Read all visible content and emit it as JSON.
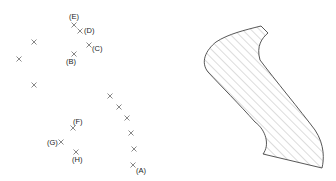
{
  "diagram": {
    "labeled_points": [
      {
        "label": "(A)",
        "x": 133,
        "y": 165,
        "lx": 136,
        "ly": 173
      },
      {
        "label": "(B)",
        "x": 74,
        "y": 54,
        "lx": 66,
        "ly": 64
      },
      {
        "label": "(C)",
        "x": 89,
        "y": 45,
        "lx": 92,
        "ly": 51
      },
      {
        "label": "(D)",
        "x": 80,
        "y": 31,
        "lx": 84,
        "ly": 33
      },
      {
        "label": "(E)",
        "x": 74,
        "y": 25,
        "lx": 69,
        "ly": 19
      },
      {
        "label": "(F)",
        "x": 73,
        "y": 128,
        "lx": 73,
        "ly": 124
      },
      {
        "label": "(G)",
        "x": 61,
        "y": 142,
        "lx": 47,
        "ly": 145
      },
      {
        "label": "(H)",
        "x": 76,
        "y": 152,
        "lx": 72,
        "ly": 162
      }
    ],
    "unlabeled_points": [
      {
        "x": 34,
        "y": 42
      },
      {
        "x": 19,
        "y": 59
      },
      {
        "x": 34,
        "y": 85
      },
      {
        "x": 110,
        "y": 96
      },
      {
        "x": 119,
        "y": 107
      },
      {
        "x": 127,
        "y": 118
      },
      {
        "x": 131,
        "y": 133
      },
      {
        "x": 134,
        "y": 149
      }
    ],
    "shape": {
      "description": "hatched region",
      "fill_pattern": "diagonal-hatch",
      "stroke_color": "#444444",
      "hatch_color": "#9a9a9a"
    }
  }
}
